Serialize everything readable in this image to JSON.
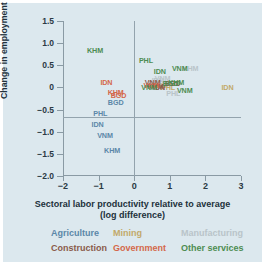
{
  "chart_data": {
    "type": "scatter",
    "title": "",
    "xlabel": "Sectoral labor productivity relative to average",
    "xlabel_line2": "(log difference)",
    "ylabel": "Change in employment share (% per year)",
    "xlim": [
      -2,
      3
    ],
    "ylim": [
      -2.0,
      1.5
    ],
    "xticks": [
      "−2",
      "−1",
      "0",
      "1",
      "2",
      "3"
    ],
    "xtick_values": [
      -2,
      -1,
      0,
      1,
      2,
      3
    ],
    "yticks": [
      "1.5",
      "1.0",
      "0.5",
      "0",
      "−0.5",
      "−1.0",
      "−1.5",
      "−2.0"
    ],
    "ytick_values": [
      1.5,
      1.0,
      0.5,
      0,
      -0.5,
      -1.0,
      -1.5,
      -2.0
    ],
    "grid": false,
    "zero_lines": true,
    "legend_position": "below",
    "series": [
      {
        "name": "Agriculture",
        "color": "#5b87a8",
        "points": [
          {
            "label": "BGD",
            "x": -0.52,
            "y": -0.33
          },
          {
            "label": "PHL",
            "x": -0.95,
            "y": -0.58
          },
          {
            "label": "IDN",
            "x": -1.03,
            "y": -0.83
          },
          {
            "label": "VNM",
            "x": -0.82,
            "y": -1.08
          },
          {
            "label": "KHM",
            "x": -0.62,
            "y": -1.42
          }
        ]
      },
      {
        "name": "Mining",
        "color": "#c2a86a",
        "points": [
          {
            "label": "IDN",
            "x": 2.62,
            "y": 0.0
          },
          {
            "label": "KHM",
            "x": 0.72,
            "y": 0.05
          },
          {
            "label": "PHL",
            "x": 0.95,
            "y": 0.02
          }
        ]
      },
      {
        "name": "Manufacturing",
        "color": "#b9c4c9",
        "points": [
          {
            "label": "KHM",
            "x": 1.58,
            "y": 0.45
          },
          {
            "label": "VNM",
            "x": 0.8,
            "y": 0.22
          },
          {
            "label": "IDN",
            "x": 0.66,
            "y": 0.17
          },
          {
            "label": "BGD",
            "x": 0.62,
            "y": 0.1
          },
          {
            "label": "PHL",
            "x": 1.1,
            "y": -0.12
          }
        ]
      },
      {
        "name": "Construction",
        "color": "#8a5a4a",
        "points": [
          {
            "label": "VNM",
            "x": 0.52,
            "y": 0.12
          },
          {
            "label": "BGD",
            "x": 1.08,
            "y": 0.1
          },
          {
            "label": "KHM",
            "x": 0.6,
            "y": 0.04
          },
          {
            "label": "IDN",
            "x": 0.7,
            "y": 0.0
          }
        ]
      },
      {
        "name": "Government",
        "color": "#d4674a",
        "points": [
          {
            "label": "IDN",
            "x": -0.78,
            "y": 0.13
          },
          {
            "label": "KHM",
            "x": -0.52,
            "y": -0.1
          },
          {
            "label": "BGD",
            "x": -0.44,
            "y": -0.16
          },
          {
            "label": "VNM",
            "x": 0.48,
            "y": 0.06
          }
        ]
      },
      {
        "name": "Other services",
        "color": "#4e8c52",
        "points": [
          {
            "label": "KHM",
            "x": -1.1,
            "y": 0.85
          },
          {
            "label": "PHL",
            "x": 0.33,
            "y": 0.63
          },
          {
            "label": "IDN",
            "x": 0.72,
            "y": 0.38
          },
          {
            "label": "VNM",
            "x": 1.28,
            "y": 0.45
          },
          {
            "label": "KHM",
            "x": 1.18,
            "y": 0.12
          },
          {
            "label": "BGD",
            "x": 1.02,
            "y": 0.11
          },
          {
            "label": "VNM",
            "x": 1.42,
            "y": -0.05
          },
          {
            "label": "VNM",
            "x": 0.42,
            "y": 0.02
          }
        ]
      }
    ]
  },
  "legend": {
    "items": [
      {
        "label": "Agriculture",
        "color": "#5b87a8"
      },
      {
        "label": "Mining",
        "color": "#c2a86a"
      },
      {
        "label": "Manufacturing",
        "color": "#b9c4c9"
      },
      {
        "label": "Construction",
        "color": "#8a5a4a"
      },
      {
        "label": "Government",
        "color": "#d4674a"
      },
      {
        "label": "Other services",
        "color": "#4e8c52"
      }
    ]
  }
}
